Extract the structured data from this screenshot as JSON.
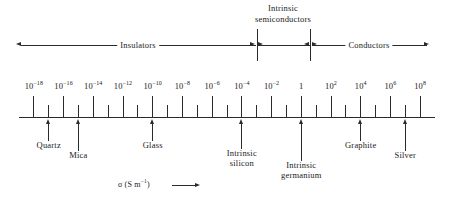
{
  "figure": {
    "kind": "conductivity-scale-diagram",
    "axis_caption_symbol": "σ",
    "axis_caption_units": "(S m",
    "axis_caption_exponent": "−1",
    "axis_caption_close": ")"
  },
  "chart_data": {
    "type": "scatter",
    "title": "",
    "xlabel": "σ (S m⁻¹)",
    "ylabel": "",
    "scale": "log10",
    "xlim": [
      -19,
      9
    ],
    "grid": false,
    "legend": null,
    "tick_labels": [
      {
        "base": "10",
        "exp": "−18",
        "decade": -18
      },
      {
        "base": "10",
        "exp": "−16",
        "decade": -16
      },
      {
        "base": "10",
        "exp": "−14",
        "decade": -14
      },
      {
        "base": "10",
        "exp": "−12",
        "decade": -12
      },
      {
        "base": "10",
        "exp": "−10",
        "decade": -10
      },
      {
        "base": "10",
        "exp": "−8",
        "decade": -8
      },
      {
        "base": "10",
        "exp": "−6",
        "decade": -6
      },
      {
        "base": "10",
        "exp": "−4",
        "decade": -4
      },
      {
        "base": "10",
        "exp": "−2",
        "decade": -2
      },
      {
        "base": "1",
        "exp": "",
        "decade": 0
      },
      {
        "base": "10",
        "exp": "2",
        "decade": 2
      },
      {
        "base": "10",
        "exp": "4",
        "decade": 4
      },
      {
        "base": "10",
        "exp": "6",
        "decade": 6
      },
      {
        "base": "10",
        "exp": "8",
        "decade": 8
      }
    ],
    "minor_tick_decades": [
      -17,
      -15,
      -13,
      -11,
      -9,
      -7,
      -5,
      -3,
      -1,
      1,
      3,
      5,
      7
    ],
    "materials": [
      {
        "name": "Quarts",
        "label": "Quartz",
        "decade": -17
      },
      {
        "name": "Mica",
        "label": "Mica",
        "decade": -15
      },
      {
        "name": "Glass",
        "label": "Glass",
        "decade": -10
      },
      {
        "name": "Intrinsic silicon",
        "label_line1": "Intrinsic",
        "label_line2": "silicon",
        "decade": -4
      },
      {
        "name": "Intrinsic germanium",
        "label_line1": "Intrinsic",
        "label_line2": "germanium",
        "decade": 0
      },
      {
        "name": "Graphite",
        "label": "Graphite",
        "decade": 4
      },
      {
        "name": "Silver",
        "label": "Silver",
        "decade": 7
      }
    ],
    "regions": [
      {
        "label": "Insulators",
        "from_decade": -19,
        "to_decade": -3
      },
      {
        "label_line1": "Intrinsic",
        "label_line2": "semiconductors",
        "from_decade": -3,
        "to_decade": 1
      },
      {
        "label": "Conductors",
        "from_decade": 1,
        "to_decade": 9
      }
    ]
  }
}
